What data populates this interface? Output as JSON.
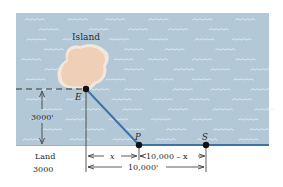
{
  "diagram": {
    "labels": {
      "island": "Island",
      "point_e": "E",
      "point_p": "P",
      "point_s": "S",
      "distance_offshore": "3000'",
      "land": "Land",
      "land_cost": "3000",
      "segment_x": "x",
      "segment_remaining": "10,000 – x",
      "segment_total": "10,000'"
    },
    "colors": {
      "water": "#b3c8d6",
      "wave": "#e6eff5",
      "island": "#efcfb5",
      "island_glow": "#f3e6dc",
      "cable": "#3f73a3",
      "shore": "#3f73a3",
      "point": "#111111",
      "line": "#333333"
    }
  }
}
